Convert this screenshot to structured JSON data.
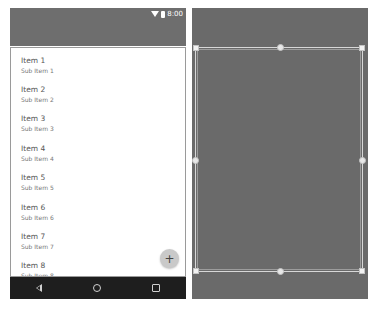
{
  "design_preview": {
    "status_bar": {
      "icons": [
        "wifi-icon",
        "battery-icon"
      ],
      "time": "8:00"
    },
    "list": {
      "items": [
        {
          "title": "Item 1",
          "subtitle": "Sub Item 1"
        },
        {
          "title": "Item 2",
          "subtitle": "Sub Item 2"
        },
        {
          "title": "Item 3",
          "subtitle": "Sub Item 3"
        },
        {
          "title": "Item 4",
          "subtitle": "Sub Item 4"
        },
        {
          "title": "Item 5",
          "subtitle": "Sub Item 5"
        },
        {
          "title": "Item 6",
          "subtitle": "Sub Item 6"
        },
        {
          "title": "Item 7",
          "subtitle": "Sub Item 7"
        },
        {
          "title": "Item 8",
          "subtitle": "Sub Item 8"
        }
      ]
    },
    "fab": {
      "icon": "plus-icon",
      "label": "+"
    },
    "nav_bar": {
      "icons": [
        "back-icon",
        "home-icon",
        "recents-icon"
      ]
    }
  },
  "blueprint": {
    "selection": {
      "handles": [
        "top-left",
        "top-center",
        "top-right",
        "middle-left",
        "middle-right",
        "bottom-left",
        "bottom-center",
        "bottom-right"
      ]
    }
  },
  "colors": {
    "appbar": "#6e6e6e",
    "navbar": "#1e1e1e",
    "blueprint_bg": "#6a6a6a",
    "fab": "#c9c9c9"
  }
}
